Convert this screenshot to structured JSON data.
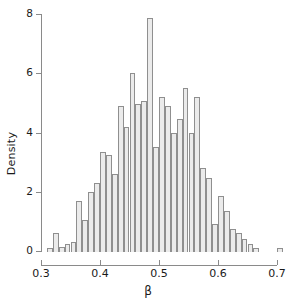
{
  "figure": {
    "type": "histogram",
    "background": "#ffffff",
    "bar_fill": "#ebebeb",
    "bar_border": "#8f8f8f",
    "axis_color": "#8a8a8a",
    "text_color": "#1a1a1a"
  },
  "axes": {
    "x": {
      "label": "β",
      "ticks": [
        0.3,
        0.4,
        0.5,
        0.6,
        0.7
      ],
      "tick_labels": [
        "0.3",
        "0.4",
        "0.5",
        "0.6",
        "0.7"
      ],
      "min": 0.3,
      "max": 0.7
    },
    "y": {
      "label": "Density",
      "ticks": [
        0,
        2,
        4,
        6,
        8
      ],
      "tick_labels": [
        "0",
        "2",
        "4",
        "6",
        "8"
      ],
      "min": 0,
      "max": 8
    }
  },
  "chart_data": {
    "type": "bar",
    "title": "",
    "subtitle": "",
    "xlabel": "β",
    "ylabel": "Density",
    "xlim": [
      0.3,
      0.71
    ],
    "ylim": [
      0,
      8
    ],
    "grid": false,
    "legend": null,
    "bin_width": 0.01,
    "bin_edges": [
      0.31,
      0.32,
      0.33,
      0.34,
      0.35,
      0.36,
      0.37,
      0.38,
      0.39,
      0.4,
      0.41,
      0.42,
      0.43,
      0.44,
      0.45,
      0.46,
      0.47,
      0.48,
      0.49,
      0.5,
      0.51,
      0.52,
      0.53,
      0.54,
      0.55,
      0.56,
      0.57,
      0.58,
      0.59,
      0.6,
      0.61,
      0.62,
      0.63,
      0.64,
      0.65,
      0.66,
      0.67,
      0.68,
      0.69,
      0.7,
      0.71
    ],
    "categories": [
      "0.31",
      "0.32",
      "0.33",
      "0.34",
      "0.35",
      "0.36",
      "0.37",
      "0.38",
      "0.39",
      "0.40",
      "0.41",
      "0.42",
      "0.43",
      "0.44",
      "0.45",
      "0.46",
      "0.47",
      "0.48",
      "0.49",
      "0.50",
      "0.51",
      "0.52",
      "0.53",
      "0.54",
      "0.55",
      "0.56",
      "0.57",
      "0.58",
      "0.59",
      "0.60",
      "0.61",
      "0.62",
      "0.63",
      "0.64",
      "0.65",
      "0.66",
      "0.67",
      "0.68",
      "0.69",
      "0.70"
    ],
    "values": [
      0.1,
      0.6,
      0.15,
      0.25,
      0.3,
      1.7,
      1.05,
      2.0,
      2.3,
      3.35,
      3.25,
      2.6,
      4.9,
      4.2,
      6.0,
      4.95,
      5.05,
      7.85,
      3.5,
      5.2,
      4.9,
      4.0,
      4.45,
      5.5,
      4.0,
      5.2,
      2.8,
      2.45,
      0.9,
      1.85,
      1.35,
      0.75,
      0.6,
      0.4,
      0.25,
      0.1,
      0.0,
      0.0,
      0.0,
      0.1
    ]
  }
}
